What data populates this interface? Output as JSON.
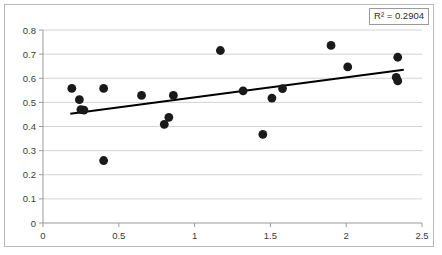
{
  "chart_data": {
    "type": "scatter",
    "title": "",
    "subtitle": "",
    "xlabel": "",
    "ylabel": "",
    "xlim": [
      0,
      2.5
    ],
    "ylim": [
      0,
      0.8
    ],
    "grid": "horizontal",
    "legend": "none",
    "x_ticks": [
      "0",
      "0.5",
      "1",
      "1.5",
      "2",
      "2.5"
    ],
    "x_tick_values": [
      0,
      0.5,
      1,
      1.5,
      2,
      2.5
    ],
    "y_ticks": [
      "0",
      "0.1",
      "0.2",
      "0.3",
      "0.4",
      "0.5",
      "0.6",
      "0.7",
      "0.8"
    ],
    "y_tick_values": [
      0,
      0.1,
      0.2,
      0.3,
      0.4,
      0.5,
      0.6,
      0.7,
      0.8
    ],
    "series": [
      {
        "name": "observations",
        "marker": "filled-circle",
        "color": "#1a1a1a",
        "points": [
          {
            "x": 0.19,
            "y": 0.558
          },
          {
            "x": 0.24,
            "y": 0.511
          },
          {
            "x": 0.27,
            "y": 0.468
          },
          {
            "x": 0.4,
            "y": 0.558
          },
          {
            "x": 0.4,
            "y": 0.259
          },
          {
            "x": 0.65,
            "y": 0.529
          },
          {
            "x": 0.8,
            "y": 0.409
          },
          {
            "x": 0.83,
            "y": 0.438
          },
          {
            "x": 0.86,
            "y": 0.529
          },
          {
            "x": 1.17,
            "y": 0.715
          },
          {
            "x": 1.32,
            "y": 0.548
          },
          {
            "x": 1.45,
            "y": 0.367
          },
          {
            "x": 1.51,
            "y": 0.518
          },
          {
            "x": 1.58,
            "y": 0.557
          },
          {
            "x": 1.9,
            "y": 0.736
          },
          {
            "x": 2.01,
            "y": 0.647
          },
          {
            "x": 2.34,
            "y": 0.687
          },
          {
            "x": 2.33,
            "y": 0.604
          },
          {
            "x": 2.34,
            "y": 0.589
          },
          {
            "x": 0.25,
            "y": 0.47
          }
        ]
      }
    ],
    "trendline": {
      "type": "linear",
      "color": "#000000",
      "x_start": 0.18,
      "y_start": 0.453,
      "x_end": 2.38,
      "y_end": 0.635
    },
    "annotations": {
      "r_squared_label": "R² = 0.2904",
      "r_squared_value": 0.2904
    }
  }
}
